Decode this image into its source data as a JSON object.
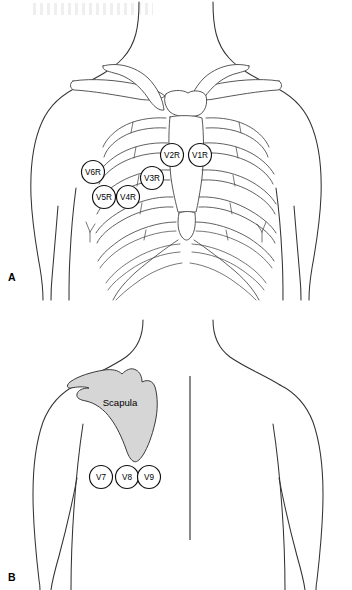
{
  "figure": {
    "panels": [
      {
        "id": "A",
        "letter": "A",
        "view": "anterior-chest",
        "description": "Anterior chest with rib cage, clavicles and sternum showing right-sided precordial electrode positions"
      },
      {
        "id": "B",
        "letter": "B",
        "view": "posterior-back",
        "description": "Posterior back showing left scapula and posterior electrode positions"
      }
    ]
  },
  "panel_a": {
    "letter": "A",
    "electrodes": [
      {
        "name": "V1R",
        "label": "V1R",
        "cx": 200,
        "cy": 155,
        "r": 11.5
      },
      {
        "name": "V2R",
        "label": "V2R",
        "cx": 172,
        "cy": 155,
        "r": 11.5
      },
      {
        "name": "V3R",
        "label": "V3R",
        "cx": 152,
        "cy": 178,
        "r": 11.5
      },
      {
        "name": "V4R",
        "label": "V4R",
        "cx": 128,
        "cy": 197,
        "r": 11.5
      },
      {
        "name": "V5R",
        "label": "V5R",
        "cx": 104,
        "cy": 197,
        "r": 11.5
      },
      {
        "name": "V6R",
        "label": "V6R",
        "cx": 93,
        "cy": 172,
        "r": 11.5
      }
    ]
  },
  "panel_b": {
    "letter": "B",
    "scapula_label": "Scapula",
    "scapula_label_x": 120,
    "scapula_label_y": 402,
    "electrodes": [
      {
        "name": "V7",
        "label": "V7",
        "cx": 101,
        "cy": 477,
        "r": 11.5
      },
      {
        "name": "V8",
        "label": "V8",
        "cx": 127,
        "cy": 477,
        "r": 11.5
      },
      {
        "name": "V9",
        "label": "V9",
        "cx": 149,
        "cy": 477,
        "r": 11.5
      }
    ]
  },
  "colors": {
    "background": "#ffffff",
    "outline": "#333333",
    "bone_stroke": "#444444",
    "scapula_fill": "#d6d6d6",
    "scapula_stroke": "#3a3a3a",
    "electrode_fill": "#ffffff",
    "electrode_stroke": "#111111",
    "text": "#000000"
  }
}
